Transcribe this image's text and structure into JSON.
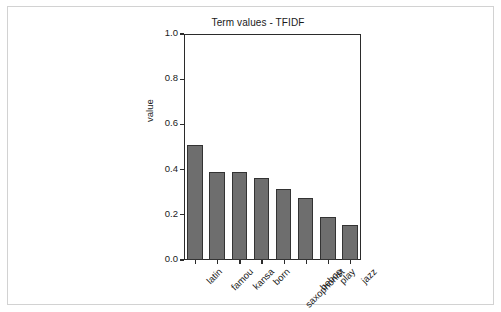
{
  "figure": {
    "border_color": "#d2d2d2",
    "background": "#ffffff"
  },
  "chart_data": {
    "type": "bar",
    "title": "Term values - TFIDF",
    "xlabel": "",
    "ylabel": "value",
    "categories": [
      "latin",
      "famou",
      "kansa",
      "born",
      "saxophonist",
      "bebop",
      "play",
      "jazz"
    ],
    "values": [
      0.51,
      0.39,
      0.39,
      0.365,
      0.315,
      0.275,
      0.19,
      0.155
    ],
    "ylim": [
      0.0,
      1.0
    ],
    "ytick_labels": [
      "0.0",
      "0.2",
      "0.4",
      "0.6",
      "0.8",
      "1.0"
    ],
    "ytick_values": [
      0.0,
      0.2,
      0.4,
      0.6,
      0.8,
      1.0
    ],
    "grid": false,
    "legend": false,
    "bar_color": "#6e6e6e",
    "bar_edge_color": "#333333",
    "axis_color": "#2b2b2b",
    "xtick_label_rotation": -45
  }
}
